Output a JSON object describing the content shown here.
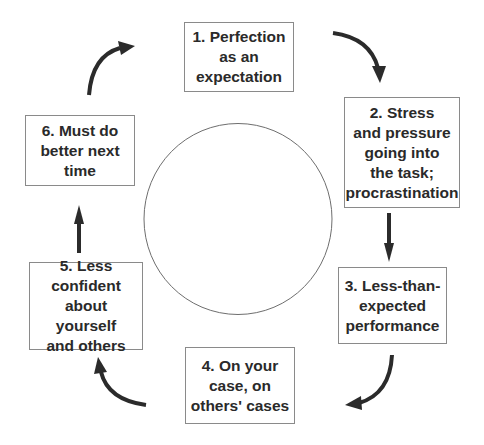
{
  "diagram": {
    "type": "cycle",
    "center_shape": "circle",
    "steps": [
      {
        "number": 1,
        "label": "1. Perfection\nas an\nexpectation"
      },
      {
        "number": 2,
        "label": "2. Stress\nand pressure\ngoing into\nthe task;\nprocrastination"
      },
      {
        "number": 3,
        "label": "3. Less-than-\nexpected\nperformance"
      },
      {
        "number": 4,
        "label": "4. On your\ncase, on\nothers' cases"
      },
      {
        "number": 5,
        "label": "5. Less\nconfident\nabout yourself\nand others"
      },
      {
        "number": 6,
        "label": "6. Must do\nbetter next\ntime"
      }
    ],
    "connections": [
      {
        "from": 1,
        "to": 2,
        "style": "curved-arrow"
      },
      {
        "from": 2,
        "to": 3,
        "style": "straight-arrow"
      },
      {
        "from": 3,
        "to": 4,
        "style": "curved-arrow"
      },
      {
        "from": 4,
        "to": 5,
        "style": "curved-arrow"
      },
      {
        "from": 5,
        "to": 6,
        "style": "straight-arrow"
      },
      {
        "from": 6,
        "to": 1,
        "style": "curved-arrow"
      }
    ],
    "colors": {
      "text": "#2a2a2a",
      "box_border": "#8a8a8a",
      "arrow": "#2b2b2b",
      "circle_stroke": "#6e6e6e",
      "background": "#ffffff"
    }
  }
}
